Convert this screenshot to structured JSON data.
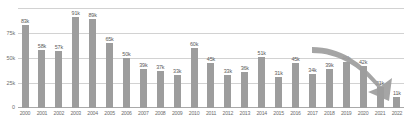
{
  "chart_data": {
    "type": "bar",
    "title": "",
    "subtitle": "",
    "xlabel": "",
    "ylabel": "",
    "ylim": [
      0,
      100000
    ],
    "grid": true,
    "legend": null,
    "legend_position": "none",
    "ytick_labels": [
      "75k",
      "50k",
      "25k",
      "0"
    ],
    "ytick_values": [
      75000,
      50000,
      25000,
      0
    ],
    "categories": [
      "2000",
      "2001",
      "2002",
      "2003",
      "2004",
      "2005",
      "2006",
      "2007",
      "2008",
      "2009",
      "2010",
      "2011",
      "2012",
      "2013",
      "2014",
      "2015",
      "2016",
      "2017",
      "2018",
      "2019",
      "2020",
      "2021",
      "2022"
    ],
    "values": [
      83000,
      58000,
      57000,
      91000,
      89000,
      65000,
      50000,
      39000,
      37000,
      33000,
      60000,
      45000,
      33000,
      36000,
      51000,
      31000,
      45000,
      34000,
      39000,
      46000,
      42000,
      21000,
      11000
    ],
    "data_labels": [
      "83k",
      "58k",
      "57k",
      "91k",
      "89k",
      "65k",
      "50k",
      "39k",
      "37k",
      "33k",
      "60k",
      "45k",
      "33k",
      "36k",
      "51k",
      "31k",
      "45k",
      "34k",
      "39k",
      "46k",
      "42k",
      "21k",
      "11k"
    ],
    "annotations": [
      {
        "name": "declining-trend-arrow",
        "type": "curved-arrow",
        "direction": "down-right",
        "color": "#9d9d9d"
      }
    ]
  },
  "colors": {
    "bar": "#9d9d9d",
    "gridline": "#d2d2d2",
    "axis": "#a9a9a9",
    "label_text": "#5a5a5a",
    "tick_text": "#6e6e6e",
    "arrow": "#9d9d9d",
    "background": "#ffffff"
  }
}
